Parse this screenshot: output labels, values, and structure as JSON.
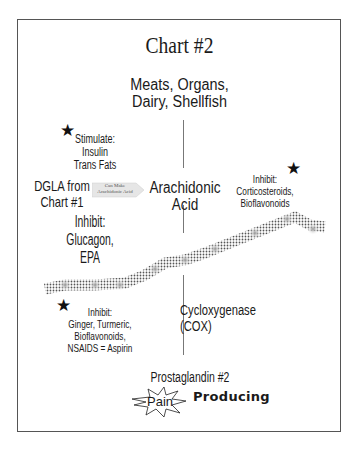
{
  "title": "Chart #2",
  "source": {
    "line1": "Meats, Organs,",
    "line2": "Dairy, Shellfish"
  },
  "stimulate": {
    "label": "Stimulate:",
    "items": [
      "Insulin",
      "Trans Fats"
    ]
  },
  "dgla": {
    "line1": "DGLA from",
    "line2": "Chart #1"
  },
  "arrow": {
    "line1": "Can Make",
    "line2": "Arachidonic Acid"
  },
  "arachidonic": {
    "line1": "Arachidonic",
    "line2": "Acid"
  },
  "inhibit_left": {
    "label": "Inhibit:",
    "items": "Glucagon, EPA"
  },
  "inhibit_right": {
    "label": "Inhibit:",
    "line1": "Corticosteroids,",
    "line2": "Bioflavonoids"
  },
  "inhibit_bottom": {
    "label": "Inhibit:",
    "line1": "Ginger, Turmeric,",
    "line2": "Bioflavonoids,",
    "line3": "NSAIDS = Aspirin"
  },
  "enzyme": "Cycloxygenase (COX)",
  "product": "Prostaglandin #2",
  "pain": "Pain",
  "producing": "Producing",
  "icons": {
    "star": "★"
  }
}
